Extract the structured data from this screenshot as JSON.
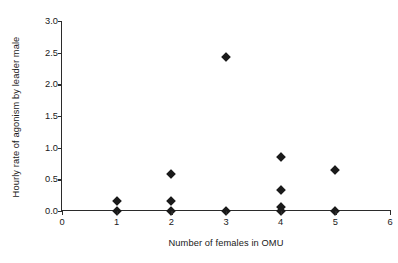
{
  "chart_data": {
    "type": "scatter",
    "title": "",
    "xlabel": "Number of females in OMU",
    "ylabel": "Hourly rate of agonism by leader male",
    "xlim": [
      0,
      6
    ],
    "ylim": [
      0,
      3.0
    ],
    "xticks": [
      "0",
      "1",
      "2",
      "3",
      "4",
      "5",
      "6"
    ],
    "xtick_values": [
      0,
      1,
      2,
      3,
      4,
      5,
      6
    ],
    "yticks": [
      "0.0",
      "0.5",
      "1.0",
      "1.5",
      "2.0",
      "2.5",
      "3.0"
    ],
    "ytick_values": [
      0.0,
      0.5,
      1.0,
      1.5,
      2.0,
      2.5,
      3.0
    ],
    "grid": false,
    "legend": false,
    "marker": "diamond",
    "marker_color": "#1a1a1a",
    "points": [
      {
        "x": 1,
        "y": 0.16
      },
      {
        "x": 1,
        "y": 0.0
      },
      {
        "x": 2,
        "y": 0.59
      },
      {
        "x": 2,
        "y": 0.16
      },
      {
        "x": 2,
        "y": 0.0
      },
      {
        "x": 3,
        "y": 2.43
      },
      {
        "x": 3,
        "y": 0.0
      },
      {
        "x": 4,
        "y": 0.85
      },
      {
        "x": 4,
        "y": 0.33
      },
      {
        "x": 4,
        "y": 0.07
      },
      {
        "x": 4,
        "y": 0.0
      },
      {
        "x": 5,
        "y": 0.64
      },
      {
        "x": 5,
        "y": 0.0
      }
    ]
  }
}
